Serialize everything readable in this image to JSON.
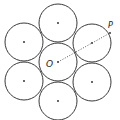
{
  "diagram": {
    "title": "",
    "labels": {
      "center": "O",
      "point": "P"
    },
    "circles": [
      {
        "name": "center",
        "cx": 58,
        "cy": 62,
        "r": 19
      },
      {
        "name": "top",
        "cx": 58,
        "cy": 23,
        "r": 19
      },
      {
        "name": "upper-left",
        "cx": 24,
        "cy": 42,
        "r": 19
      },
      {
        "name": "upper-right",
        "cx": 92,
        "cy": 43,
        "r": 19
      },
      {
        "name": "lower-left",
        "cx": 24,
        "cy": 81,
        "r": 19
      },
      {
        "name": "lower-right",
        "cx": 92,
        "cy": 82,
        "r": 19
      },
      {
        "name": "bottom",
        "cx": 58,
        "cy": 101,
        "r": 19
      }
    ],
    "dotted_line": {
      "from": "O",
      "through": "upper-right center",
      "to": "P"
    },
    "colors": {
      "stroke": "#3a3a3a",
      "dot": "#222222",
      "background": "#ffffff"
    }
  }
}
